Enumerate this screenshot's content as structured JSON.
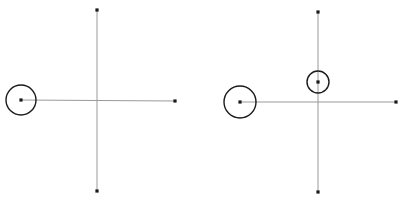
{
  "canvas": {
    "width": 403,
    "height": 198,
    "background": "#ffffff"
  },
  "colors": {
    "axis": "#9a9a9a",
    "ink": "#1a1a1a"
  },
  "figures": [
    {
      "name": "left-figure",
      "center": [
        97,
        101
      ],
      "axes": {
        "horizontal": {
          "x1": 21,
          "y1": 100,
          "x2": 175,
          "y2": 101
        },
        "vertical": {
          "x1": 97,
          "y1": 10,
          "x2": 97,
          "y2": 191
        }
      },
      "points": [
        {
          "name": "top-point",
          "x": 97,
          "y": 10
        },
        {
          "name": "right-point",
          "x": 175,
          "y": 101
        },
        {
          "name": "bottom-point",
          "x": 97,
          "y": 191
        },
        {
          "name": "left-point",
          "x": 21,
          "y": 100
        }
      ],
      "circles": [
        {
          "name": "left-circle",
          "cx": 21,
          "cy": 100,
          "r": 15
        }
      ]
    },
    {
      "name": "right-figure",
      "center": [
        318,
        102
      ],
      "axes": {
        "horizontal": {
          "x1": 240,
          "y1": 102,
          "x2": 396,
          "y2": 102
        },
        "vertical": {
          "x1": 318,
          "y1": 12,
          "x2": 318,
          "y2": 192
        }
      },
      "points": [
        {
          "name": "top-point",
          "x": 318,
          "y": 12
        },
        {
          "name": "right-point",
          "x": 396,
          "y": 102
        },
        {
          "name": "bottom-point",
          "x": 318,
          "y": 192
        },
        {
          "name": "left-point",
          "x": 240,
          "y": 102
        },
        {
          "name": "inner-point",
          "x": 318,
          "y": 82
        }
      ],
      "circles": [
        {
          "name": "left-circle",
          "cx": 240,
          "cy": 102,
          "r": 16
        },
        {
          "name": "inner-circle",
          "cx": 318,
          "cy": 82,
          "r": 11
        }
      ]
    }
  ]
}
